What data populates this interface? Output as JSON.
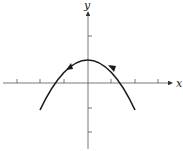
{
  "diagram": {
    "type": "parabola-graph",
    "axes": {
      "x_label": "x",
      "y_label": "y",
      "x_ticks": [
        -3,
        -2,
        -1,
        1,
        2,
        3
      ],
      "y_ticks": [
        -2,
        -1,
        1,
        2
      ]
    },
    "curve": {
      "shape": "parabola",
      "vertex": [
        0,
        1
      ],
      "x_intercepts": [
        -1.4,
        1.4
      ],
      "endpoints": [
        [
          -2,
          -1.2
        ],
        [
          2,
          -1.2
        ]
      ],
      "direction_arrows": "right-to-left"
    },
    "colors": {
      "axis": "#333333",
      "curve": "#1a1a1a"
    }
  }
}
